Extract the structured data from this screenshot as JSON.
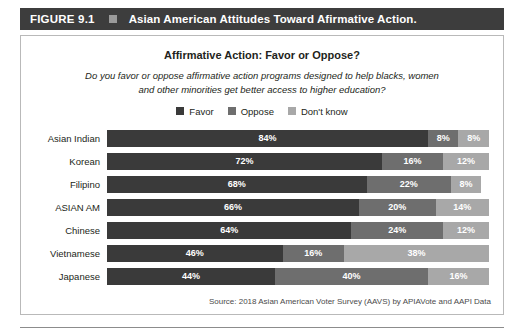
{
  "figure": {
    "number": "FIGURE 9.1",
    "marker_icon": "square-marker-icon",
    "title": "Asian American Attitudes Toward Afirmative Action."
  },
  "chart": {
    "title": "Affirmative Action: Favor or Oppose?",
    "subtitle": "Do you favor or oppose affirmative action programs designed to help blacks, women and other minorities get better access to higher education?",
    "source": "Source: 2018 Asian American Voter Survey (AAVS) by APIAVote and AAPI Data"
  },
  "colors": {
    "favor": "#3a3a3a",
    "oppose": "#6e6e6e",
    "dont_know": "#a8a8a8",
    "header_bar": "#3d3d3d",
    "panel_border": "#b9b9b9"
  },
  "legend": {
    "items": [
      {
        "label": "Favor",
        "color": "#3a3a3a"
      },
      {
        "label": "Oppose",
        "color": "#6e6e6e"
      },
      {
        "label": "Don't know",
        "color": "#a8a8a8"
      }
    ]
  },
  "chart_data": {
    "type": "bar",
    "orientation": "horizontal",
    "stacked": true,
    "title": "Affirmative Action: Favor or Oppose?",
    "subtitle": "Do you favor or oppose affirmative action programs designed to help blacks, women and other minorities get better access to higher education?",
    "xlabel": "",
    "ylabel": "",
    "xlim": [
      0,
      100
    ],
    "unit": "%",
    "grid": false,
    "legend_position": "top-center",
    "categories": [
      "Asian Indian",
      "Korean",
      "Filipino",
      "ASIAN AM",
      "Chinese",
      "Vietnamese",
      "Japanese"
    ],
    "series": [
      {
        "name": "Favor",
        "color": "#3a3a3a",
        "values": [
          84,
          72,
          68,
          66,
          64,
          46,
          44
        ]
      },
      {
        "name": "Oppose",
        "color": "#6e6e6e",
        "values": [
          8,
          16,
          22,
          20,
          24,
          16,
          40
        ]
      },
      {
        "name": "Don't know",
        "color": "#a8a8a8",
        "values": [
          8,
          12,
          8,
          14,
          12,
          38,
          16
        ]
      }
    ],
    "rows": [
      {
        "label": "Asian Indian",
        "favor": "84%",
        "oppose": "8%",
        "dont_know": "8%",
        "favor_v": 84,
        "oppose_v": 8,
        "dk_v": 8
      },
      {
        "label": "Korean",
        "favor": "72%",
        "oppose": "16%",
        "dont_know": "12%",
        "favor_v": 72,
        "oppose_v": 16,
        "dk_v": 12
      },
      {
        "label": "Filipino",
        "favor": "68%",
        "oppose": "22%",
        "dont_know": "8%",
        "favor_v": 68,
        "oppose_v": 22,
        "dk_v": 8
      },
      {
        "label": "ASIAN AM",
        "favor": "66%",
        "oppose": "20%",
        "dont_know": "14%",
        "favor_v": 66,
        "oppose_v": 20,
        "dk_v": 14
      },
      {
        "label": "Chinese",
        "favor": "64%",
        "oppose": "24%",
        "dont_know": "12%",
        "favor_v": 64,
        "oppose_v": 24,
        "dk_v": 12
      },
      {
        "label": "Vietnamese",
        "favor": "46%",
        "oppose": "16%",
        "dont_know": "38%",
        "favor_v": 46,
        "oppose_v": 16,
        "dk_v": 38
      },
      {
        "label": "Japanese",
        "favor": "44%",
        "oppose": "40%",
        "dont_know": "16%",
        "favor_v": 44,
        "oppose_v": 40,
        "dk_v": 16
      }
    ]
  }
}
